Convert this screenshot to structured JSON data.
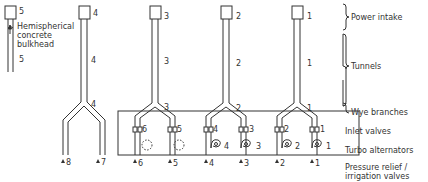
{
  "legend": {
    "power_intake": "Power intake",
    "tunnels": "Tunnels",
    "wye_branches": "Wye branches",
    "inlet_valves": "Inlet valves",
    "turbo_alternators": "Turbo alternators",
    "pressure_relief_line1": "Pressure relief /",
    "pressure_relief_line2": "irrigation valves"
  },
  "annotation": {
    "line1": "Hemispherical",
    "line2": "concrete",
    "line3": "bulkhead"
  },
  "intakes": [
    {
      "intake": "5",
      "tunnel": "5"
    },
    {
      "intake": "4",
      "tunnel": "4",
      "wye": "4",
      "outlets": [
        "8",
        "7"
      ]
    },
    {
      "intake": "3",
      "tunnel": "3",
      "wye": "3",
      "valves": [
        "6",
        "5"
      ],
      "relief": [
        "6",
        "5"
      ]
    },
    {
      "intake": "2",
      "tunnel": "2",
      "wye": "2",
      "valves": [
        "4",
        "3"
      ],
      "turbines": [
        "4",
        "3"
      ],
      "relief": [
        "4",
        "3"
      ]
    },
    {
      "intake": "1",
      "tunnel": "1",
      "wye": "1",
      "valves": [
        "2",
        "1"
      ],
      "turbines": [
        "2",
        "1"
      ],
      "relief": [
        "2",
        "1"
      ]
    }
  ]
}
